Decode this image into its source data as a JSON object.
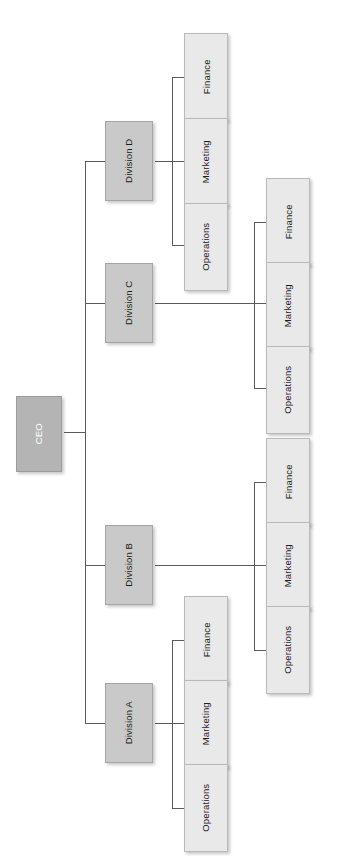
{
  "diagram": {
    "orientation": "rotated-90",
    "colors": {
      "root_fill": "#b4b4b4",
      "division_fill": "#c9c9c9",
      "leaf_fill": "#e9e9e9",
      "connector": "#5a5a5a",
      "background": "#ffffff",
      "root_text": "#ffffff",
      "node_text": "#1c1c1c"
    },
    "root": {
      "label": "CEO"
    },
    "divisions": [
      {
        "label": "Division D",
        "children": [
          {
            "label": "Finance"
          },
          {
            "label": "Marketing"
          },
          {
            "label": "Operations"
          }
        ]
      },
      {
        "label": "Division C",
        "children": [
          {
            "label": "Finance"
          },
          {
            "label": "Marketing"
          },
          {
            "label": "Operations"
          }
        ]
      },
      {
        "label": "Division B",
        "children": [
          {
            "label": "Finance"
          },
          {
            "label": "Marketing"
          },
          {
            "label": "Operations"
          }
        ]
      },
      {
        "label": "Division A",
        "children": [
          {
            "label": "Finance"
          },
          {
            "label": "Marketing"
          },
          {
            "label": "Operations"
          }
        ]
      }
    ]
  }
}
